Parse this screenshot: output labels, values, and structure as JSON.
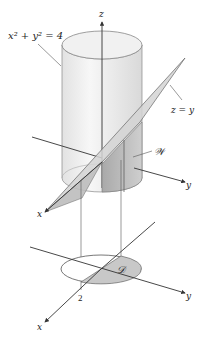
{
  "figure": {
    "labels": {
      "cylinder_eq": "x² + y² = 4",
      "plane_eq": "z = y",
      "solid": "𝒲",
      "region": "𝒟",
      "z_axis": "z",
      "y_axis_upper": "y",
      "x_axis_upper": "x",
      "y_axis_lower": "y",
      "x_axis_lower": "x",
      "radius_tick": "2"
    },
    "colors": {
      "axis": "#333333",
      "cylinder_fill": "#ececec",
      "cylinder_shade": "#d6d6d6",
      "plane_fill": "#cfcfcf",
      "solid_fill": "#b9b9b9",
      "region_fill": "#c8c8c8"
    }
  }
}
